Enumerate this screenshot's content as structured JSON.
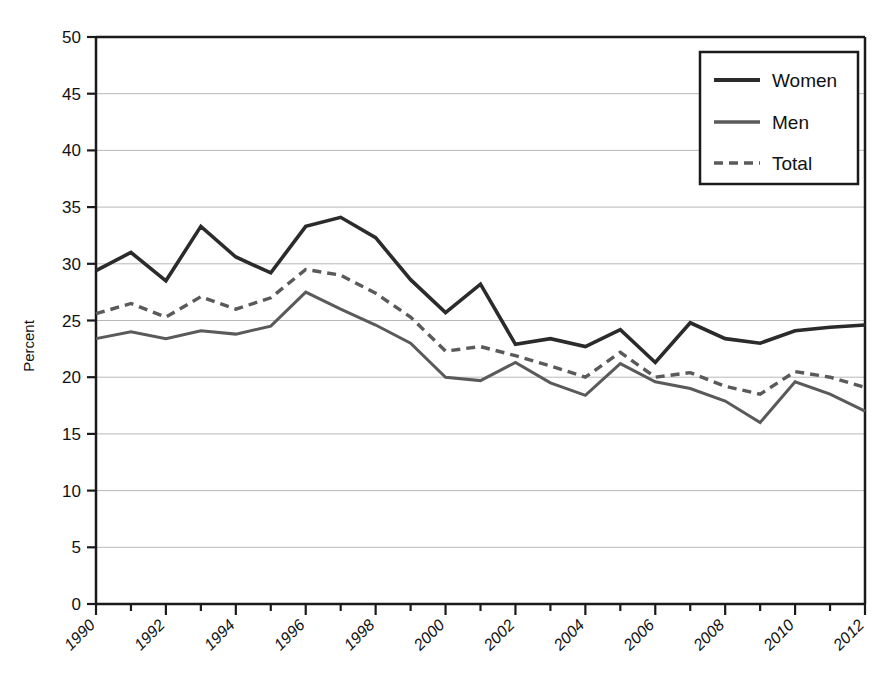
{
  "chart_data": {
    "type": "line",
    "title": "",
    "xlabel": "",
    "ylabel": "Percent",
    "xlim": [
      1990,
      2012
    ],
    "ylim": [
      0,
      50
    ],
    "ytick_step": 5,
    "yticks": [
      0,
      5,
      10,
      15,
      20,
      25,
      30,
      35,
      40,
      45,
      50
    ],
    "xticks": [
      1990,
      1992,
      1994,
      1996,
      1998,
      2000,
      2002,
      2004,
      2006,
      2008,
      2010,
      2012
    ],
    "x": [
      1990,
      1991,
      1992,
      1993,
      1994,
      1995,
      1996,
      1997,
      1998,
      1999,
      2000,
      2001,
      2002,
      2003,
      2004,
      2005,
      2006,
      2007,
      2008,
      2009,
      2010,
      2011,
      2012
    ],
    "grid": "horizontal",
    "legend_position": "top-right",
    "series": [
      {
        "name": "Women",
        "style": "solid",
        "color": "#2b2b2b",
        "width": 3.6,
        "values": [
          29.4,
          31.0,
          28.5,
          33.3,
          30.6,
          29.2,
          33.3,
          34.1,
          32.3,
          28.6,
          25.7,
          28.2,
          22.9,
          23.4,
          22.7,
          24.2,
          21.3,
          24.8,
          23.4,
          23.0,
          24.1,
          24.4,
          24.6
        ]
      },
      {
        "name": "Men",
        "style": "solid",
        "color": "#5a5a5a",
        "width": 3.0,
        "values": [
          23.4,
          24.0,
          23.4,
          24.1,
          23.8,
          24.5,
          27.5,
          26.0,
          24.6,
          23.0,
          20.0,
          19.7,
          21.3,
          19.5,
          18.4,
          21.2,
          19.6,
          19.0,
          17.9,
          16.0,
          19.6,
          18.5,
          17.0
        ]
      },
      {
        "name": "Total",
        "style": "dashed",
        "color": "#5a5a5a",
        "width": 3.4,
        "values": [
          25.6,
          26.5,
          25.3,
          27.1,
          26.0,
          27.0,
          29.5,
          29.0,
          27.4,
          25.3,
          22.3,
          22.7,
          21.9,
          21.0,
          20.0,
          22.2,
          20.0,
          20.4,
          19.2,
          18.5,
          20.5,
          20.0,
          19.1
        ]
      }
    ]
  },
  "axis": {
    "ylabel": "Percent",
    "ytick_labels": [
      "0",
      "5",
      "10",
      "15",
      "20",
      "25",
      "30",
      "35",
      "40",
      "45",
      "50"
    ],
    "xtick_labels": [
      "1990",
      "1992",
      "1994",
      "1996",
      "1998",
      "2000",
      "2002",
      "2004",
      "2006",
      "2008",
      "2010",
      "2012"
    ]
  },
  "legend": {
    "items": [
      {
        "label": "Women"
      },
      {
        "label": "Men"
      },
      {
        "label": "Total"
      }
    ]
  }
}
